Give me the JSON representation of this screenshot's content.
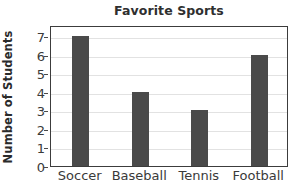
{
  "chart_data": {
    "type": "bar",
    "title": "Favorite Sports",
    "xlabel": "",
    "ylabel": "Number of Students",
    "categories": [
      "Soccer",
      "Baseball",
      "Tennis",
      "Football"
    ],
    "values": [
      7,
      4,
      3,
      6
    ],
    "ylim": [
      0,
      7.6
    ],
    "yticks": [
      0,
      1,
      2,
      3,
      4,
      5,
      6,
      7
    ],
    "ytick_labels": [
      "0",
      "1",
      "2",
      "3",
      "4",
      "5",
      "6",
      "7"
    ],
    "grid": "horizontal",
    "legend": "none",
    "colors": {
      "bar": "#4a4a4a",
      "gridline": "#e2e2e2",
      "axis_border": "#3c3c3c",
      "title_text": "#2f2f2f",
      "tick_text": "#3a3a3a",
      "background": "#ffffff"
    }
  }
}
